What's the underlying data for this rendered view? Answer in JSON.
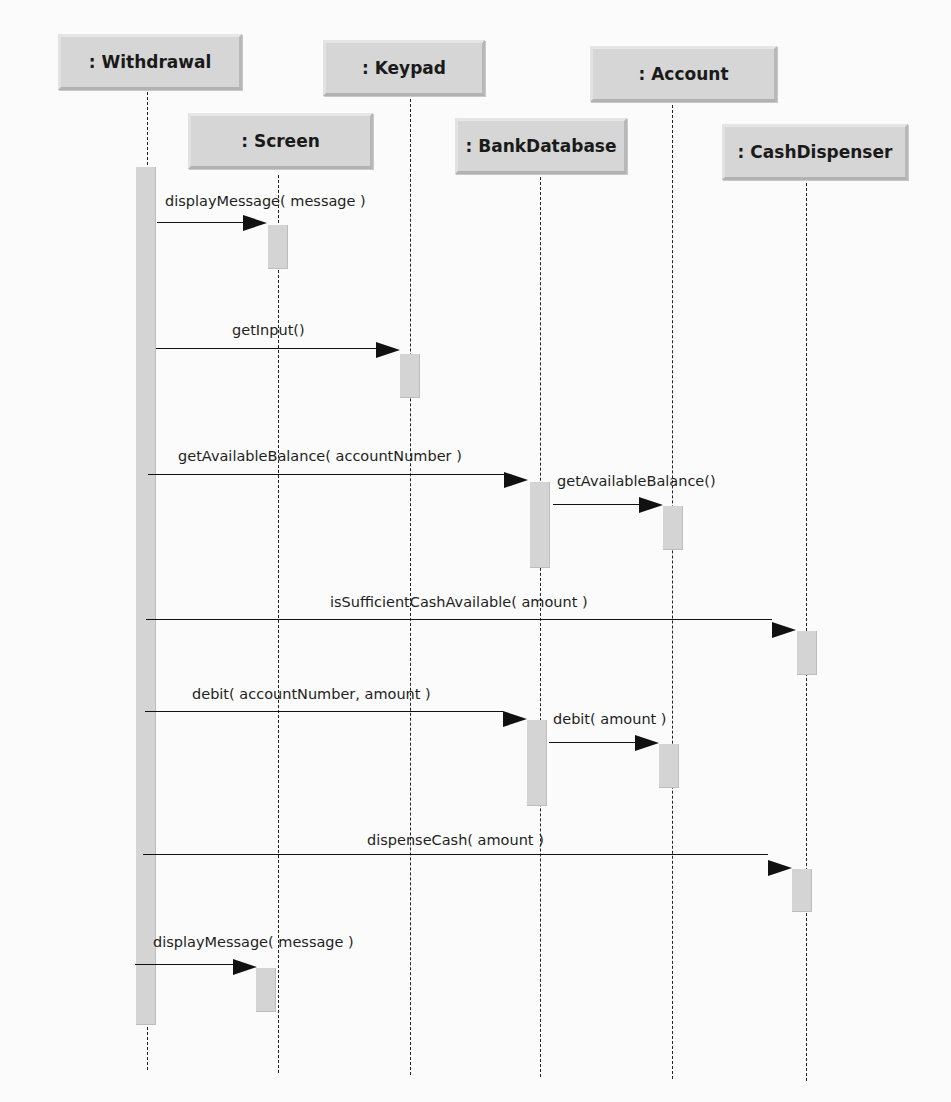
{
  "diagram": {
    "type": "UML sequence diagram",
    "objects": [
      {
        "id": "withdrawal",
        "label": ": Withdrawal"
      },
      {
        "id": "screen",
        "label": ": Screen"
      },
      {
        "id": "keypad",
        "label": ": Keypad"
      },
      {
        "id": "bankdatabase",
        "label": ": BankDatabase"
      },
      {
        "id": "account",
        "label": ": Account"
      },
      {
        "id": "cashdispenser",
        "label": ": CashDispenser"
      }
    ],
    "messages": [
      {
        "from": "withdrawal",
        "to": "screen",
        "label": "displayMessage( message )"
      },
      {
        "from": "withdrawal",
        "to": "keypad",
        "label": "getInput()"
      },
      {
        "from": "withdrawal",
        "to": "bankdatabase",
        "label": "getAvailableBalance( accountNumber )"
      },
      {
        "from": "bankdatabase",
        "to": "account",
        "label": "getAvailableBalance()"
      },
      {
        "from": "withdrawal",
        "to": "cashdispenser",
        "label": "isSufficientCashAvailable( amount )"
      },
      {
        "from": "withdrawal",
        "to": "bankdatabase",
        "label": "debit( accountNumber, amount )"
      },
      {
        "from": "bankdatabase",
        "to": "account",
        "label": "debit( amount )"
      },
      {
        "from": "withdrawal",
        "to": "cashdispenser",
        "label": "dispenseCash( amount )"
      },
      {
        "from": "withdrawal",
        "to": "screen",
        "label": "displayMessage( message )"
      }
    ]
  }
}
